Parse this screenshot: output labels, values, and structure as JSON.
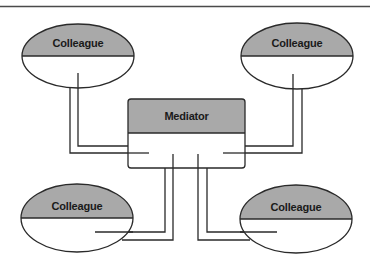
{
  "diagram": {
    "colors": {
      "line": "#2a2a2a",
      "fill_header": "#a9a9a9",
      "fill_body": "#ffffff",
      "frame_line": "#4a4a4a"
    },
    "mediator": {
      "label": "Mediator"
    },
    "colleagues": [
      {
        "position": "top-left",
        "label": "Colleague"
      },
      {
        "position": "top-right",
        "label": "Colleague"
      },
      {
        "position": "bottom-left",
        "label": "Colleague"
      },
      {
        "position": "bottom-right",
        "label": "Colleague"
      }
    ]
  }
}
